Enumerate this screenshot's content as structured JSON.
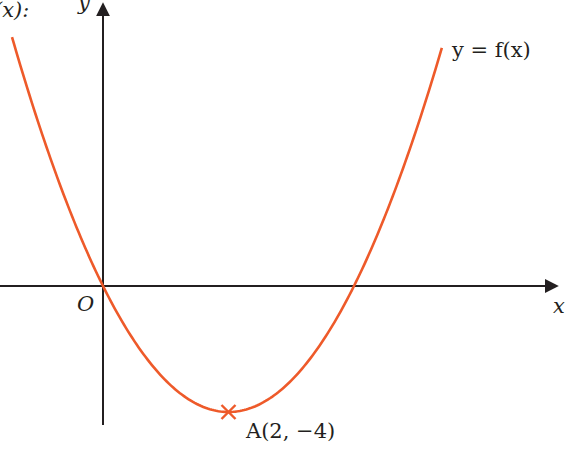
{
  "chart_data": {
    "type": "line",
    "title": "",
    "function": "y = x^2 - 4x",
    "curve_label": "y = f(x)",
    "xlabel": "x",
    "ylabel": "y",
    "origin_label": "O",
    "roots": [
      0,
      4
    ],
    "turning_point": {
      "label": "A(2, −4)",
      "x": 2,
      "y": -4
    },
    "x_range": [
      -1.45,
      5.4
    ],
    "series": [
      {
        "name": "y = f(x)",
        "color": "#ee5a2a",
        "x": [
          -1.4,
          0,
          1,
          2,
          3,
          4,
          5.35
        ],
        "y": [
          7.56,
          0,
          -3,
          -4,
          -3,
          0,
          7.22
        ]
      }
    ],
    "grid": false
  },
  "labels": {
    "top_left_fragment": "(x):",
    "y_axis": "y",
    "x_axis": "x",
    "origin": "O",
    "curve": "y = f(x)",
    "point": "A(2, −4)"
  },
  "colors": {
    "curve": "#ee5a2a",
    "axes": "#231f20"
  }
}
